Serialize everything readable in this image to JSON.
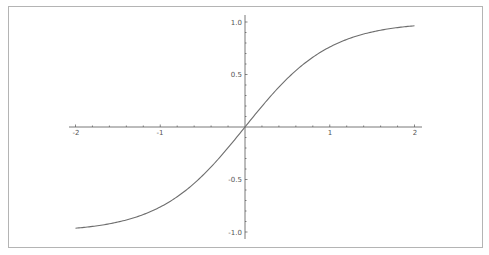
{
  "chart_data": {
    "type": "line",
    "title": "",
    "xlabel": "",
    "ylabel": "",
    "function": "tanh(x)",
    "xlim": [
      -2,
      2
    ],
    "ylim": [
      -1,
      1
    ],
    "grid": false,
    "legend": null,
    "x_ticks": [
      "-2",
      "-1",
      "1",
      "2"
    ],
    "y_ticks": [
      "1.0",
      "0.5",
      "-0.5",
      "-1.0"
    ],
    "series": [
      {
        "name": "tanh(x)",
        "color": "#6e6e6e",
        "x": [
          -2.0,
          -1.75,
          -1.5,
          -1.25,
          -1.0,
          -0.75,
          -0.5,
          -0.25,
          0.0,
          0.25,
          0.5,
          0.75,
          1.0,
          1.25,
          1.5,
          1.75,
          2.0
        ],
        "y": [
          -0.964,
          -0.941,
          -0.905,
          -0.848,
          -0.762,
          -0.635,
          -0.462,
          -0.245,
          0.0,
          0.245,
          0.462,
          0.635,
          0.762,
          0.848,
          0.905,
          0.941,
          0.964
        ]
      }
    ]
  },
  "axes": {
    "x_tick_labels": [
      "-2",
      "-1",
      "1",
      "2"
    ],
    "y_tick_labels": [
      "1.0",
      "0.5",
      "-0.5",
      "-1.0"
    ],
    "axis_color": "#555555",
    "curve_color": "#6e6e6e"
  }
}
